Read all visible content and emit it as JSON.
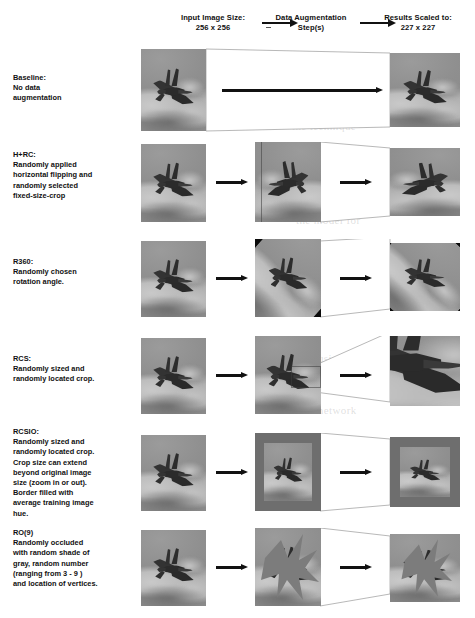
{
  "header": {
    "input_label": "Input Image Size:\n256 x 256",
    "input_line1": "Input Image Size:",
    "input_line2": "256 x 256",
    "aug_line1": "Data Augmentation",
    "aug_line2": "Step(s)",
    "result_line1": "Results Scaled to:",
    "result_line2": "227 x 227"
  },
  "rows": [
    {
      "id": "baseline",
      "label": "Baseline:\nNo data\naugmentation",
      "label_lines": [
        "Baseline:",
        "No data",
        "augmentation"
      ],
      "has_middle_tile": false,
      "arrow_kind": "long",
      "y": 47,
      "height": 86
    },
    {
      "id": "hrc",
      "label": "H+RC:\nRandomly applied\nhorizontal flipping and\nrandomly selected\nfixed-size-crop",
      "label_lines": [
        "H+RC:",
        "Randomly applied",
        "horizontal flipping and",
        "randomly selected",
        "fixed-size-crop"
      ],
      "has_middle_tile": true,
      "arrow_kind": "short",
      "y": 142,
      "height": 82
    },
    {
      "id": "r360",
      "label": "R360:\nRandomly chosen\nrotation angle.",
      "label_lines": [
        "R360:",
        "Randomly chosen",
        "rotation angle."
      ],
      "has_middle_tile": true,
      "arrow_kind": "short",
      "y": 239,
      "height": 80
    },
    {
      "id": "rcs",
      "label": "RCS:\nRandomly sized and\nrandomly located crop.",
      "label_lines": [
        "RCS:",
        "Randomly sized and",
        "randomly located crop."
      ],
      "has_middle_tile": true,
      "arrow_kind": "short",
      "y": 336,
      "height": 80
    },
    {
      "id": "rcsio",
      "label": "RCSIO:\nRandomly sized and\nrandomly located crop.\nCrop size can extend\nbeyond original image\nsize (zoom in or out).\nBorder filled with\naverage training image\nhue.",
      "label_lines": [
        "RCSIO:",
        "Randomly sized and",
        "randomly located crop.",
        "Crop size can extend",
        "beyond original image",
        "size (zoom in or out).",
        "Border filled with",
        "average training image",
        "hue."
      ],
      "has_middle_tile": true,
      "arrow_kind": "short",
      "y": 433,
      "height": 80
    },
    {
      "id": "ro9",
      "label": "RO(9)\nRandomly occluded\nwith random shade of\ngray, random number\n(ranging from 3 - 9 )\nand location of vertices.",
      "label_lines": [
        "RO(9)",
        "Randomly occluded",
        "with random shade of",
        "gray, random number",
        "(ranging from 3 - 9 )",
        "and location of vertices."
      ],
      "has_middle_tile": true,
      "arrow_kind": "short",
      "y": 528,
      "height": 80
    }
  ],
  "colors": {
    "ink": "#141414",
    "arrow": "#111111",
    "page": "#ffffff",
    "sky": "#8f8f8f",
    "jet": "#2e2e2e",
    "rotation_fill": "#0b0b0b",
    "hue_fill": "#6e6e6e",
    "occlusion_gray": "#7b7b7b",
    "connector_line": "#9a9a9a"
  },
  "ghost_text": [
    {
      "t": "the technique",
      "x": 292,
      "y": 120
    },
    {
      "t": "and augmented",
      "x": 300,
      "y": 176
    },
    {
      "t": "the model for",
      "x": 296,
      "y": 214
    },
    {
      "t": "random crop",
      "x": 300,
      "y": 252
    },
    {
      "t": "scaled down",
      "x": 304,
      "y": 300
    },
    {
      "t": "occlusion of",
      "x": 298,
      "y": 352
    },
    {
      "t": "the network",
      "x": 300,
      "y": 404
    },
    {
      "t": "augmentation",
      "x": 298,
      "y": 470
    },
    {
      "t": "training data",
      "x": 300,
      "y": 560
    }
  ]
}
